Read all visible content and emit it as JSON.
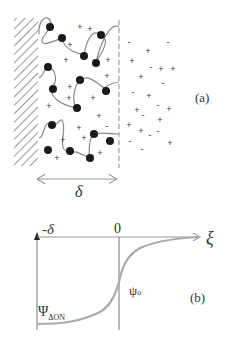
{
  "panel_a": {
    "label": "(a)",
    "thickness_symbol": "δ",
    "plus_sign": "+",
    "minus_sign": "-"
  },
  "panel_b": {
    "label": "(b)",
    "axis_left_label": "-δ",
    "axis_zero_label": "0",
    "axis_x_label": "ξ",
    "psi_zero_main": "ψ",
    "psi_zero_sub": "o",
    "psi_don_main": "Ψ",
    "psi_don_sub": "ΔON"
  },
  "colors": {
    "ink": "#333333",
    "curve": "#9a9a9a",
    "hatch": "#444444",
    "particle": "#1a1a1a"
  }
}
